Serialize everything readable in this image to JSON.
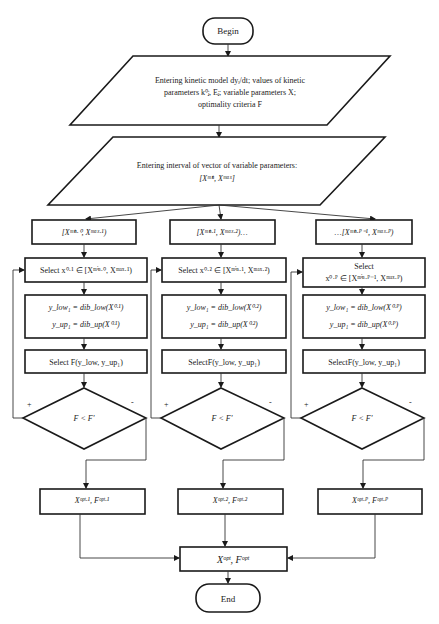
{
  "diagram": {
    "type": "flowchart",
    "begin": "Begin",
    "end": "End",
    "input1": {
      "line1": "Entering kinetic model dyᵢ/dt; values of kinetic",
      "line2": "parameters k⁰ⱼ, Eⱼ; variable parameters X;",
      "line3": "optimality criteria F"
    },
    "input2": {
      "line1": "Entering interval of vector of variable parameters:",
      "line2": "[Xᵐⁱⁿ, Xᵐᵃˣ]"
    },
    "branches": [
      {
        "interval": "[Xᵐⁱⁿ·⁰, Xᵐᵃˣ·¹)",
        "select_line1": "Select x⁰·¹ ∈ [Xᵐⁱⁿ·⁰, Xᵐᵃˣ·¹)",
        "select_line2": "",
        "calc_low": "y_low₁ = dib_low(X⁰·¹)",
        "calc_up": "y_up₁ = dib_up(X⁰·¹)",
        "select_f": "Select F(y_low, y_up₁)",
        "decision": "F < F'",
        "yes": "+",
        "no": "-",
        "result": "Xᵒᵖᵗ·¹, Fᵒᵖᵗ·¹"
      },
      {
        "interval": "[Xᵐⁱⁿ·¹, Xᵐᵃˣ·²)…",
        "select_line1": "Select x⁰·² ∈ [Xᵐⁱⁿ·¹, Xᵐᵃˣ·²)",
        "select_line2": "",
        "calc_low": "y_low₁ = dib_low(X⁰·²)",
        "calc_up": "y_up₁ = dib_up(X⁰·²)",
        "select_f": "SelectF(y_low, y_up₁)",
        "decision": "F < F'",
        "yes": "+",
        "no": "-",
        "result": "Xᵒᵖᵗ·², Fᵒᵖᵗ·²"
      },
      {
        "interval": "…[Xᵐⁱⁿ·ᴾ⁻¹, Xᵐᵃˣ·ᴾ)",
        "select_line1": "Select",
        "select_line2": "x⁰·ᴾ ∈ [Xᵐⁱⁿ·ᴾ⁻¹, Xᵐᵃˣ·ᴾ)",
        "calc_low": "y_low₁ = dib_low(X⁰·ᴾ)",
        "calc_up": "y_up₁ = dib_up(X⁰·ᴾ)",
        "select_f": "SelectF(y_low, y_up₁)",
        "decision": "F < F'",
        "yes": "+",
        "no": "-",
        "result": "Xᵒᵖᵗ·ᴾ, Fᵒᵖᵗ·ᴾ"
      }
    ],
    "final": "Xᵒᵖᵗ, Fᵒᵖᵗ",
    "colors": {
      "stroke": "#1a1a1a",
      "fill": "#ffffff",
      "background": "#ffffff"
    }
  }
}
